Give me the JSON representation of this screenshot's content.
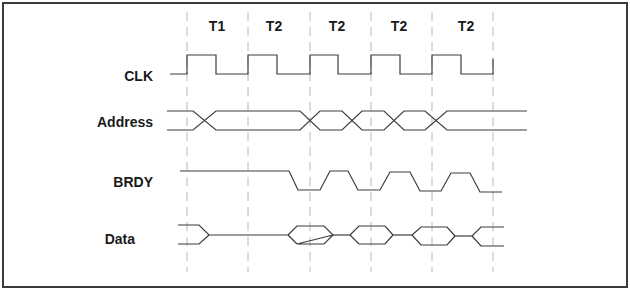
{
  "diagram": {
    "cycles": [
      {
        "label": "T1",
        "x": 217
      },
      {
        "label": "T2",
        "x": 275
      },
      {
        "label": "T2",
        "x": 337
      },
      {
        "label": "T2",
        "x": 399
      },
      {
        "label": "T2",
        "x": 465
      }
    ],
    "gridlines_x": [
      187,
      248,
      310,
      371,
      432,
      493
    ],
    "signals": [
      {
        "name": "CLK",
        "label_x": 153,
        "label_y": 81
      },
      {
        "name": "Address",
        "label_x": 153,
        "label_y": 127
      },
      {
        "name": "BRDY",
        "label_x": 153,
        "label_y": 182
      },
      {
        "name": "Data",
        "label_x": 135,
        "label_y": 243
      }
    ],
    "colors": {
      "line": "#3c3c3c",
      "grid": "#b8b8b8",
      "border": "#3a3a3a",
      "text": "#1a1a1a"
    }
  }
}
